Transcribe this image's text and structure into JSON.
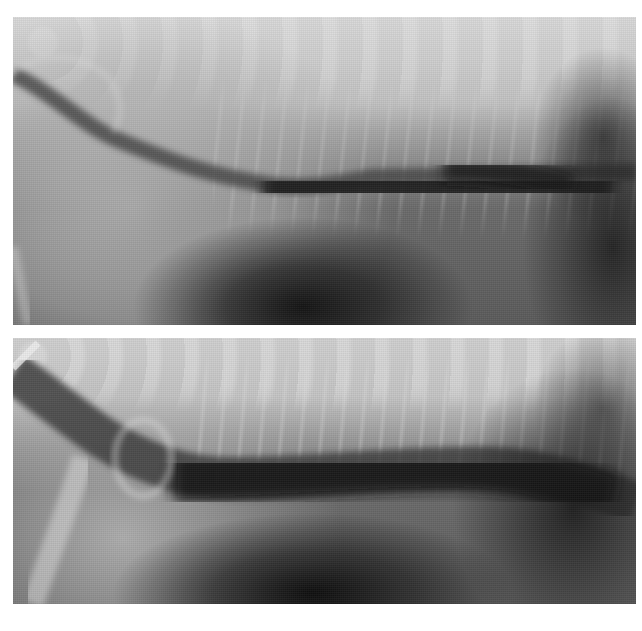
{
  "figure": {
    "panels": [
      {
        "id": "top",
        "description": "Lateral thoracic radiograph with contrast-filled esophagus (upper image)"
      },
      {
        "id": "bottom",
        "description": "Lateral thoracic radiograph with contrast-filled, dilated esophagus (lower image)"
      }
    ],
    "colors": {
      "background": "#ffffff",
      "film_light": "#cfcfcf",
      "film_mid": "#8a8a8a",
      "film_dark": "#1a1a1a"
    }
  }
}
